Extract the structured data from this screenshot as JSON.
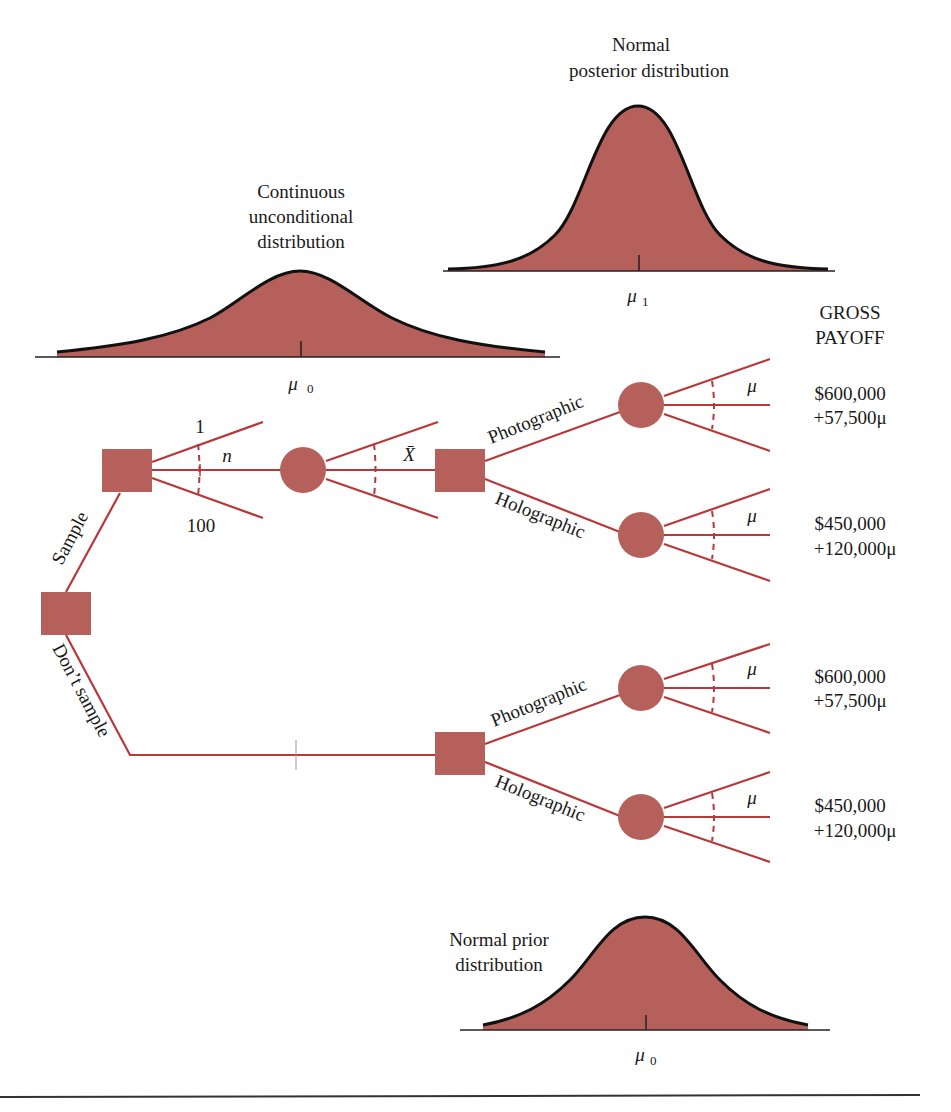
{
  "colors": {
    "node_fill": "#b5605a",
    "branch_line": "#b8383a",
    "curve_outline": "#111111"
  },
  "distributions": {
    "unconditional": {
      "title_lines": [
        "Continuous",
        "unconditional",
        "distribution"
      ],
      "mean_label": "μ",
      "mean_sub": "0"
    },
    "posterior": {
      "title_lines": [
        "Normal",
        "posterior distribution"
      ],
      "mean_label": "μ",
      "mean_sub": "1"
    },
    "prior": {
      "title_lines": [
        "Normal prior",
        "distribution"
      ],
      "mean_label": "μ",
      "mean_sub": "0"
    }
  },
  "payoff_header": [
    "GROSS",
    "PAYOFF"
  ],
  "tree": {
    "root_branches": {
      "sample": "Sample",
      "dont_sample": "Don’t sample"
    },
    "sample_size": {
      "min": "1",
      "var": "n",
      "max": "100"
    },
    "sample_result": {
      "var": "X̄"
    },
    "acts": {
      "photographic": "Photographic",
      "holographic": "Holographic"
    },
    "state_var": "μ",
    "payoffs": [
      {
        "branch": "sample-photographic",
        "lines": [
          "$600,000",
          "+57,500μ"
        ]
      },
      {
        "branch": "sample-holographic",
        "lines": [
          "$450,000",
          "+120,000μ"
        ]
      },
      {
        "branch": "nosample-photographic",
        "lines": [
          "$600,000",
          "+57,500μ"
        ]
      },
      {
        "branch": "nosample-holographic",
        "lines": [
          "$450,000",
          "+120,000μ"
        ]
      }
    ]
  }
}
